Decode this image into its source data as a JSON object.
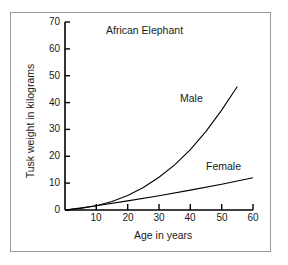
{
  "chart_data": {
    "type": "line",
    "title": "African Elephant",
    "xlabel": "Age in years",
    "ylabel": "Tusk weight in kilograms",
    "xlim": [
      0,
      60
    ],
    "ylim": [
      0,
      70
    ],
    "xticks": [
      10,
      20,
      30,
      40,
      50,
      60
    ],
    "yticks": [
      0,
      10,
      20,
      30,
      40,
      50,
      60,
      70
    ],
    "grid": false,
    "legend": "inline-annotations",
    "line_color": "#000000",
    "series": [
      {
        "name": "Male",
        "x": [
          0,
          5,
          10,
          15,
          20,
          25,
          30,
          35,
          40,
          45,
          50,
          55
        ],
        "values": [
          0,
          0.6,
          1.6,
          3.2,
          5.4,
          8.4,
          12.2,
          16.8,
          22.5,
          29.3,
          37.2,
          46.0
        ]
      },
      {
        "name": "Female",
        "x": [
          0,
          10,
          20,
          30,
          40,
          50,
          60
        ],
        "values": [
          0,
          1.6,
          3.4,
          5.3,
          7.4,
          9.6,
          12.0
        ]
      }
    ]
  },
  "labels": {
    "title": "African Elephant",
    "male": "Male",
    "female": "Female",
    "xaxis": "Age in years",
    "yaxis": "Tusk weight in kilograms",
    "y70": "70",
    "y60": "60",
    "y50": "50",
    "y40": "40",
    "y30": "30",
    "y20": "20",
    "y10": "10",
    "y0": "0",
    "x10": "10",
    "x20": "20",
    "x30": "30",
    "x40": "40",
    "x50": "50",
    "x60": "60"
  }
}
